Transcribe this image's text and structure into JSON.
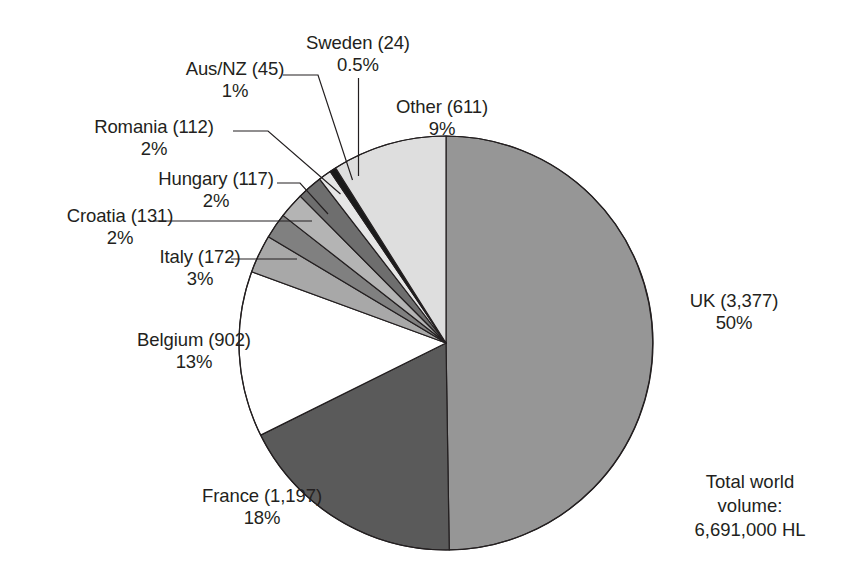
{
  "chart_data": {
    "type": "pie",
    "title": "",
    "subtitle": "",
    "unit": "HL (thousands)",
    "total_label_lines": [
      "Total world",
      "volume:",
      "6,691,000 HL"
    ],
    "total_value": "6,691,000 HL",
    "legend_position": "callout-labels",
    "grid": false,
    "start_angle_deg": 0,
    "direction": "clockwise-for-uk",
    "categories": [
      "UK",
      "France",
      "Belgium",
      "Italy",
      "Croatia",
      "Hungary",
      "Romania",
      "Aus/NZ",
      "Sweden",
      "Other"
    ],
    "values": [
      3377,
      1197,
      902,
      172,
      131,
      117,
      112,
      45,
      24,
      611
    ],
    "percents": [
      "50%",
      "18%",
      "13%",
      "3%",
      "2%",
      "2%",
      "2%",
      "1%",
      "0.5%",
      "9%"
    ],
    "slices": [
      {
        "name": "UK",
        "value": 3377,
        "value_text": "3,377",
        "label": "UK (3,377)",
        "percent": "50%",
        "percent_num": 50.0,
        "color": "#969696"
      },
      {
        "name": "France",
        "value": 1197,
        "value_text": "1,197",
        "label": "France (1,197)",
        "percent": "18%",
        "percent_num": 18.0,
        "color": "#5a5a5a"
      },
      {
        "name": "Belgium",
        "value": 902,
        "value_text": "902",
        "label": "Belgium (902)",
        "percent": "13%",
        "percent_num": 13.0,
        "color": "#ffffff"
      },
      {
        "name": "Italy",
        "value": 172,
        "value_text": "172",
        "label": "Italy (172)",
        "percent": "3%",
        "percent_num": 3.0,
        "color": "#a8a8a8"
      },
      {
        "name": "Croatia",
        "value": 131,
        "value_text": "131",
        "label": "Croatia (131)",
        "percent": "2%",
        "percent_num": 2.0,
        "color": "#808080"
      },
      {
        "name": "Hungary",
        "value": 117,
        "value_text": "117",
        "label": "Hungary (117)",
        "percent": "2%",
        "percent_num": 2.0,
        "color": "#b4b4b4"
      },
      {
        "name": "Romania",
        "value": 112,
        "value_text": "112",
        "label": "Romania (112)",
        "percent": "2%",
        "percent_num": 2.0,
        "color": "#6e6e6e"
      },
      {
        "name": "Aus/NZ",
        "value": 45,
        "value_text": "45",
        "label": "Aus/NZ (45)",
        "percent": "1%",
        "percent_num": 1.0,
        "color": "#e6e6e6"
      },
      {
        "name": "Sweden",
        "value": 24,
        "value_text": "24",
        "label": "Sweden (24)",
        "percent": "0.5%",
        "percent_num": 0.5,
        "color": "#1a1a1a"
      },
      {
        "name": "Other",
        "value": 611,
        "value_text": "611",
        "label": "Other (611)",
        "percent": "9%",
        "percent_num": 9.0,
        "color": "#dedede"
      }
    ]
  },
  "labels": {
    "sweden": {
      "name": "Sweden (24)",
      "percent": "0.5%"
    },
    "ausnz": {
      "name": "Aus/NZ (45)",
      "percent": "1%"
    },
    "romania": {
      "name": "Romania (112)",
      "percent": "2%"
    },
    "hungary": {
      "name": "Hungary (117)",
      "percent": "2%"
    },
    "croatia": {
      "name": "Croatia (131)",
      "percent": "2%"
    },
    "italy": {
      "name": "Italy (172)",
      "percent": "3%"
    },
    "belgium": {
      "name": "Belgium (902)",
      "percent": "13%"
    },
    "france": {
      "name": "France (1,197)",
      "percent": "18%"
    },
    "uk": {
      "name": "UK (3,377)",
      "percent": "50%"
    },
    "other": {
      "name": "Other (611)",
      "percent": "9%"
    }
  },
  "total_note": {
    "line1": "Total world",
    "line2": "volume:",
    "line3": "6,691,000 HL"
  },
  "geometry": {
    "cx": 446,
    "cy": 343,
    "r": 207,
    "stroke": "#231f20",
    "stroke_width": 1.2
  },
  "colors": {
    "text": "#231f20",
    "outline": "#231f20",
    "background": "#ffffff"
  }
}
